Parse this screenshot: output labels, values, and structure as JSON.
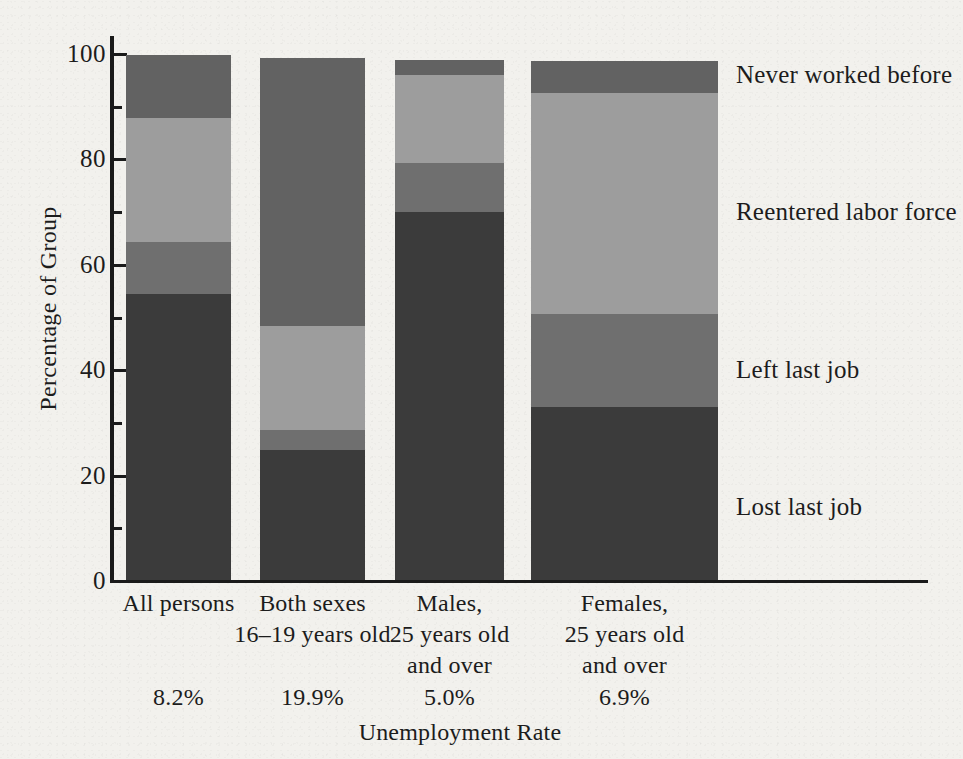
{
  "chart_data": {
    "type": "bar",
    "subtype": "stacked-bar-100",
    "title": "",
    "xlabel": "Unemployment Rate",
    "ylabel": "Percentage of Group",
    "ylim": [
      0,
      100
    ],
    "yticks": [
      0,
      20,
      40,
      60,
      80,
      100
    ],
    "ytick_labels": [
      "0",
      "20",
      "40",
      "60",
      "80",
      "100"
    ],
    "yminor_ticks": [
      10,
      30,
      50,
      70,
      90
    ],
    "grid": false,
    "legend_position": "right-aligned-to-segments",
    "categories": [
      "All persons",
      "Both sexes 16–19 years old",
      "Males, 25 years old and over",
      "Females, 25 years old and over"
    ],
    "category_lines": [
      [
        "All persons"
      ],
      [
        "Both sexes",
        "16–19 years old"
      ],
      [
        "Males,",
        "25 years old",
        "and over"
      ],
      [
        "Females,",
        "25 years old",
        "and over"
      ]
    ],
    "annotations": {
      "unemployment_rate_label": "Unemployment Rate",
      "unemployment_rates": [
        "8.2%",
        "19.9%",
        "5.0%",
        "6.9%"
      ]
    },
    "series": [
      {
        "name": "Lost last job",
        "color": "#3b3b3b",
        "values": [
          54.2,
          24.6,
          69.8,
          32.8
        ]
      },
      {
        "name": "Left last job",
        "color": "#6f6f6f",
        "values": [
          10.0,
          3.8,
          9.3,
          17.6
        ]
      },
      {
        "name": "Reentered labor force",
        "color": "#9d9d9d",
        "values": [
          23.5,
          19.8,
          16.7,
          42.1
        ]
      },
      {
        "name": "Never worked before",
        "color": "#626262",
        "values": [
          12.0,
          50.8,
          2.8,
          5.9
        ]
      }
    ],
    "totals": [
      99.7,
      99.0,
      98.6,
      98.4
    ]
  },
  "axis": {
    "y_title": "Percentage of Group",
    "x_title": "Unemployment Rate"
  },
  "legend": {
    "items": [
      {
        "label": "Never worked before",
        "color": "#626262"
      },
      {
        "label": "Reentered labor force",
        "color": "#9d9d9d"
      },
      {
        "label": "Left last job",
        "color": "#6f6f6f"
      },
      {
        "label": "Lost last job",
        "color": "#3b3b3b"
      }
    ],
    "positions_top": [
      60,
      197,
      355,
      492
    ]
  },
  "colors": {
    "background": "#f2f1ed",
    "ink": "#1c1c1c",
    "lost_last_job": "#3b3b3b",
    "left_last_job": "#6f6f6f",
    "reentered_labor_force": "#9d9d9d",
    "never_worked_before": "#626262"
  }
}
